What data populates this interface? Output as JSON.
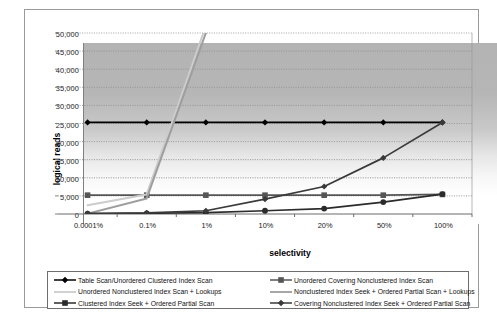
{
  "chart_data": {
    "type": "line",
    "title": "",
    "xlabel": "selectivity",
    "ylabel": "logical reads",
    "categories": [
      "0.0001%",
      "0.1%",
      "1%",
      "10%",
      "20%",
      "50%",
      "100%"
    ],
    "ylim": [
      0,
      50000
    ],
    "ytick_labels": [
      "0",
      "5,000",
      "10,000",
      "15,000",
      "20,000",
      "25,000",
      "30,000",
      "35,000",
      "40,000",
      "45,000",
      "50,000"
    ],
    "ytick_values": [
      0,
      5000,
      10000,
      15000,
      20000,
      25000,
      30000,
      35000,
      40000,
      45000,
      50000
    ],
    "grid": "horizontal-dotted",
    "legend_position": "bottom",
    "series": [
      {
        "name": "Table Scan/Unordered Clustered Index Scan",
        "color": "#000000",
        "marker": "diamond",
        "values": [
          25300,
          25300,
          25300,
          25300,
          25300,
          25300,
          25300
        ]
      },
      {
        "name": "Unordered Covering Nonclustered Index Scan",
        "color": "#555555",
        "marker": "square",
        "values": [
          5200,
          5200,
          5200,
          5200,
          5200,
          5200,
          5400
        ]
      },
      {
        "name": "Unordered Nonclustered Index Scan + Lookups",
        "color": "#cccccc",
        "marker": "none",
        "values": [
          2400,
          5400,
          52000,
          null,
          null,
          null,
          null
        ]
      },
      {
        "name": "Nonclustered Index Seek + Ordered Partial Scan + Lookups",
        "color": "#9e9e9e",
        "marker": "none",
        "values": [
          100,
          4300,
          50000,
          null,
          null,
          null,
          null
        ]
      },
      {
        "name": "Clustered Index Seek + Ordered Partial Scan",
        "color": "#2b2b2b",
        "marker": "circle",
        "values": [
          100,
          200,
          400,
          900,
          1500,
          3300,
          5500
        ]
      },
      {
        "name": "Covering Nonclustered Index Seek + Ordered Partial Scan",
        "color": "#3a3a3a",
        "marker": "diamond",
        "values": [
          100,
          300,
          900,
          4100,
          7600,
          15500,
          25300
        ]
      }
    ]
  },
  "axes": {
    "y_title": "logical reads",
    "x_title": "selectivity"
  },
  "legend": {
    "rows": [
      [
        {
          "label": "Table Scan/Unordered Clustered Index Scan",
          "color": "#000000",
          "marker": "diamond"
        },
        {
          "label": "Unordered Covering Nonclustered Index Scan",
          "color": "#555555",
          "marker": "square"
        }
      ],
      [
        {
          "label": "Unordered Nonclustered Index Scan + Lookups",
          "color": "#cccccc",
          "marker": "none"
        },
        {
          "label": "Nonclustered Index Seek + Ordered Partial Scan + Lookups",
          "color": "#9e9e9e",
          "marker": "none"
        }
      ],
      [
        {
          "label": "Clustered Index Seek + Ordered Partial Scan",
          "color": "#2b2b2b",
          "marker": "plus"
        },
        {
          "label": "Covering Nonclustered Index Seek + Ordered Partial Scan",
          "color": "#3a3a3a",
          "marker": "diamond"
        }
      ]
    ]
  }
}
